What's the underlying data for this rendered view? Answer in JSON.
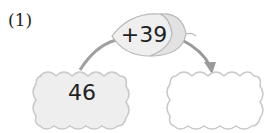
{
  "problem": {
    "label": "(1)",
    "operator_text": "+39",
    "start_value": "46",
    "answer_value": ""
  },
  "colors": {
    "box_fill_filled": "#eeeeee",
    "box_fill_empty": "#ffffff",
    "box_stroke": "#c8c8c8",
    "arrow": "#9a9a9a",
    "acorn_fill": "#efefef",
    "acorn_cap": "#e2e2e2"
  }
}
